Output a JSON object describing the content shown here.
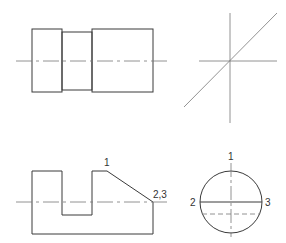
{
  "colors": {
    "outline": "#3a3a3a",
    "centerline": "#777777",
    "background": "#ffffff",
    "label": "#333333"
  },
  "views": {
    "front_view": {
      "name": "Front view (stepped cylinder)"
    },
    "miter_view": {
      "name": "45° miter construction"
    },
    "top_view": {
      "name": "Top view (slotted block)",
      "labels": {
        "p1": "1",
        "p23": "2,3"
      }
    },
    "side_view": {
      "name": "Side view (circle)",
      "labels": {
        "p1": "1",
        "p2": "2",
        "p3": "3"
      }
    }
  }
}
